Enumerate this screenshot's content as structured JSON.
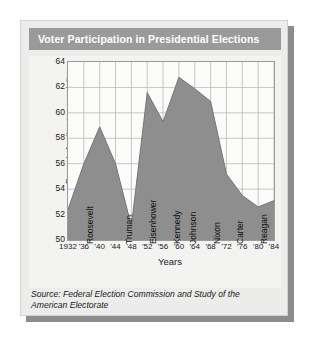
{
  "card": {
    "title": "Voter Participation in Presidential Elections",
    "source": "Source: Federal Election Commission and Study of the American Electorate",
    "colors": {
      "banner": "#9a9a9a",
      "card_bg": "#ececeb",
      "plot_bg": "#fbfbfa",
      "area_fill": "#8e8e8e",
      "grid": "#b9b9b7",
      "axis": "#9b9b9b",
      "title_text": "#ffffff"
    }
  },
  "chart_data": {
    "type": "area",
    "title": "Voter Participation in Presidential Elections",
    "xlabel": "Years",
    "ylabel": "Percent of voting age population",
    "xlim": [
      1932,
      1984
    ],
    "ylim": [
      50,
      64
    ],
    "grid": true,
    "legend": "none",
    "x": [
      1932,
      1936,
      1940,
      1944,
      1948,
      1952,
      1956,
      1960,
      1964,
      1968,
      1972,
      1976,
      1980,
      1984
    ],
    "xtick_labels": [
      "1932",
      "'36",
      "'40",
      "'44",
      "'48",
      "'52",
      "'56",
      "'60",
      "'64",
      "'68",
      "'72",
      "'76",
      "'80",
      "'84"
    ],
    "ytick_labels": [
      "50",
      "52",
      "54",
      "56",
      "58",
      "60",
      "62",
      "64"
    ],
    "ytick_values": [
      50,
      52,
      54,
      56,
      58,
      60,
      62,
      64
    ],
    "values": [
      52.4,
      56.0,
      58.9,
      56.0,
      51.1,
      61.6,
      59.3,
      62.8,
      61.9,
      60.9,
      55.2,
      53.5,
      52.6,
      53.1
    ],
    "series": [
      {
        "name": "Percent of voting age population",
        "values": [
          52.4,
          56.0,
          58.9,
          56.0,
          51.1,
          61.6,
          59.3,
          62.8,
          61.9,
          60.9,
          55.2,
          53.5,
          52.6,
          53.1
        ]
      }
    ],
    "annotations": [
      {
        "label": "Roosevelt",
        "x_start": 1932,
        "x_end": 1944
      },
      {
        "label": "Truman",
        "x_start": 1948,
        "x_end": 1948
      },
      {
        "label": "Eisenhower",
        "x_start": 1952,
        "x_end": 1956
      },
      {
        "label": "Kennedy",
        "x_start": 1960,
        "x_end": 1960
      },
      {
        "label": "Johnson",
        "x_start": 1964,
        "x_end": 1964
      },
      {
        "label": "Nixon",
        "x_start": 1968,
        "x_end": 1972
      },
      {
        "label": "Carter",
        "x_start": 1976,
        "x_end": 1976
      },
      {
        "label": "Reagan",
        "x_start": 1980,
        "x_end": 1984
      }
    ]
  }
}
